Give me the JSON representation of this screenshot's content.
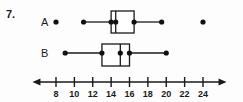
{
  "question": {
    "number": "7."
  },
  "axis": {
    "min": 6.2,
    "max": 25.8,
    "tick_values": [
      8,
      10,
      12,
      14,
      16,
      18,
      20,
      22,
      24
    ],
    "tick_labels": [
      "8",
      "10",
      "12",
      "14",
      "16",
      "18",
      "20",
      "22",
      "24"
    ],
    "left_arrow": true,
    "right_arrow": true,
    "color": "#1a1a1a"
  },
  "chart_data": {
    "type": "boxplot",
    "title": "",
    "xlabel": "",
    "ylabel": "",
    "xlim": [
      6.2,
      25.8
    ],
    "grid": false,
    "legend": "none",
    "series": [
      {
        "name": "A",
        "label": "A",
        "min": 11,
        "q1": 14,
        "median": 14.5,
        "q3": 16.5,
        "max": 19.5,
        "outliers": [
          8,
          24
        ],
        "whisker_end_dots": [
          11,
          19.5
        ],
        "quartile_dots": [
          14,
          14.5,
          16.5
        ]
      },
      {
        "name": "B",
        "label": "B",
        "min": 9,
        "q1": 13,
        "median": 15,
        "q3": 16,
        "max": 20,
        "outliers": [],
        "whisker_end_dots": [
          9,
          20
        ],
        "quartile_dots": [
          13,
          15,
          16
        ]
      }
    ]
  },
  "rows": [
    {
      "label": "A"
    },
    {
      "label": "B"
    }
  ]
}
